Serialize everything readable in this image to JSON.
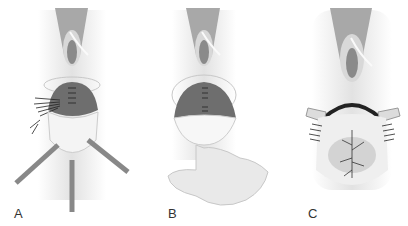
{
  "figure": {
    "panels": [
      {
        "label": "A",
        "description": "Muscle plication with sutures, retractors"
      },
      {
        "label": "B",
        "description": "Sutured muscle layer, digital examination"
      },
      {
        "label": "C",
        "description": "Closure with skin sutures"
      }
    ]
  },
  "colors": {
    "background": "#ffffff",
    "tissue_light": "#e6e6e6",
    "tissue_mid": "#bdbdbd",
    "tissue_dark": "#7a7a7a",
    "muscle": "#6e6e6e",
    "suture": "#222222",
    "label_text": "#333333"
  }
}
